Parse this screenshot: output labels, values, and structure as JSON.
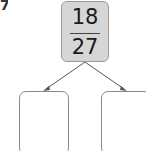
{
  "question_number": "7",
  "fraction": {
    "numerator": "18",
    "denominator": "27"
  },
  "answer_boxes": [
    {
      "value": ""
    },
    {
      "value": ""
    }
  ],
  "colors": {
    "top_box_fill": "#d6d6d6",
    "border": "#8a8a8a",
    "arrow": "#555555"
  }
}
